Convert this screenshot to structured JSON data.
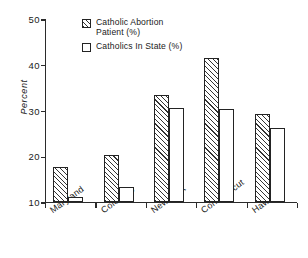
{
  "chart_data": {
    "type": "bar",
    "title": "",
    "subtitle": "",
    "xlabel": "",
    "ylabel": "Percent",
    "ylim": [
      10,
      50
    ],
    "ytick_labels": [
      "10",
      "20",
      "30",
      "40",
      "50"
    ],
    "ytick_values": [
      10,
      20,
      30,
      40,
      50
    ],
    "grid": false,
    "legend_position": "top-center",
    "categories": [
      "Maryland",
      "Colorado",
      "New York",
      "Connecticut",
      "Hawaii"
    ],
    "series": [
      {
        "name": "Catholic Abortion\nPatient (%)",
        "name_plain": "Catholic Abortion Patient (%)",
        "style": "hatched",
        "values": [
          17.6,
          20.2,
          33.2,
          41.3,
          29.1
        ]
      },
      {
        "name": "Catholics In State (%)",
        "name_plain": "Catholics In State (%)",
        "style": "plain",
        "values": [
          11.1,
          13.3,
          30.4,
          30.2,
          26.2
        ]
      }
    ],
    "annotations": []
  },
  "style": {
    "axis_color": "#2b2b2b",
    "bar_edge_color": "#232323",
    "hatch_color": "#333333",
    "plain_fill": "#ffffff",
    "background": "#ffffff",
    "text_color": "#1a1a1a"
  }
}
